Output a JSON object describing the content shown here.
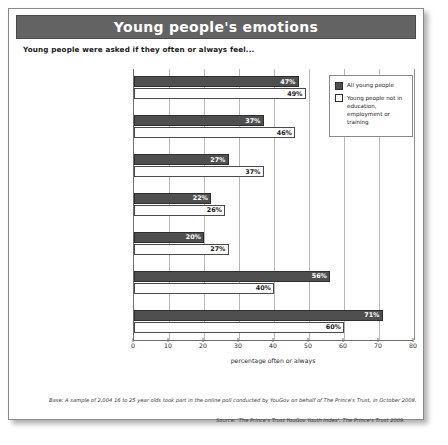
{
  "title": "Young people's emotions",
  "subtitle": "Young people were asked if they often or always feel...",
  "legend": {
    "series1": "All young people",
    "series2": "Young people not in education, employment or training"
  },
  "notes": {
    "base": "Base: A sample of 2,004 16 to 25 year olds took part in the online poll conducted by YouGov on behalf of The Prince's Trust, in October 2008.",
    "source": "Source: 'The Prince's Trust YouGov Youth Index', The Prince's Trust 2009."
  },
  "chart_data": {
    "type": "bar",
    "orientation": "horizontal",
    "title": "Young people's emotions",
    "subtitle": "Young people were asked if they often or always feel...",
    "xlabel": "percentage often or always",
    "ylabel": "",
    "xlim": [
      0,
      80
    ],
    "xticks": [
      0,
      10,
      20,
      30,
      40,
      50,
      60,
      70,
      80
    ],
    "grid": true,
    "legend_position": "top-right",
    "categories": [
      "Stressed",
      "Anxious",
      "Down/Depressed",
      "Angry (like losing my temper)",
      "Sad (like crying)",
      "Excited",
      "Happy"
    ],
    "series": [
      {
        "name": "All young people",
        "color": "#4f4f4f",
        "values": [
          47,
          37,
          27,
          22,
          20,
          56,
          71
        ],
        "labels": [
          "47%",
          "37%",
          "27%",
          "22%",
          "20%",
          "56%",
          "71%"
        ]
      },
      {
        "name": "Young people not in education, employment or training",
        "color": "#ffffff",
        "values": [
          49,
          46,
          37,
          26,
          27,
          40,
          60
        ],
        "labels": [
          "49%",
          "46%",
          "37%",
          "26%",
          "27%",
          "40%",
          "60%"
        ]
      }
    ]
  }
}
